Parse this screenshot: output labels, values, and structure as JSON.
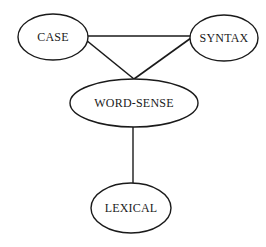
{
  "diagram": {
    "type": "undirected-graph",
    "nodes": [
      {
        "id": "case",
        "label": "CASE",
        "cx": 53,
        "cy": 37,
        "rx": 35,
        "ry": 23
      },
      {
        "id": "syntax",
        "label": "SYNTAX",
        "cx": 224,
        "cy": 38,
        "rx": 34,
        "ry": 23
      },
      {
        "id": "word-sense",
        "label": "WORD-SENSE",
        "cx": 134,
        "cy": 103,
        "rx": 64,
        "ry": 24
      },
      {
        "id": "lexical",
        "label": "LEXICAL",
        "cx": 131,
        "cy": 208,
        "rx": 40,
        "ry": 25
      }
    ],
    "edges": [
      {
        "from": "CASE",
        "to": "SYNTAX"
      },
      {
        "from": "CASE",
        "to": "WORD-SENSE"
      },
      {
        "from": "SYNTAX",
        "to": "WORD-SENSE"
      },
      {
        "from": "WORD-SENSE",
        "to": "LEXICAL"
      }
    ],
    "colors": {
      "stroke": "#1a1a1a",
      "background": "#ffffff"
    }
  }
}
